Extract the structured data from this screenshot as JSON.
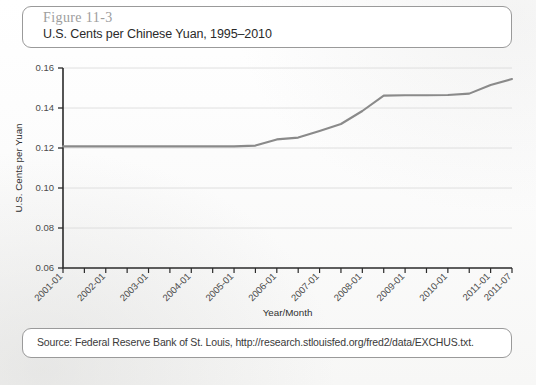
{
  "figure": {
    "number": "Figure 11-3",
    "title": "U.S. Cents per Chinese Yuan, 1995–2010",
    "source": "Source: Federal Reserve Bank of St. Louis, http://research.stlouisfed.org/fred2/data/EXCHUS.txt."
  },
  "colors": {
    "line": "#8a8a8a",
    "axis": "#2b2b2b",
    "grid": "#d8d8d8",
    "border": "#9a9a9a",
    "fig_number": "#9d9d9d"
  },
  "chart_data": {
    "type": "line",
    "title": "U.S. Cents per Chinese Yuan, 1995–2010",
    "xlabel": "Year/Month",
    "ylabel": "U.S. Cents per Yuan",
    "ylim": [
      0.06,
      0.16
    ],
    "ytick_labels": [
      "0.06",
      "0.08",
      "0.10",
      "0.12",
      "0.14",
      "0.16"
    ],
    "ytick_values": [
      0.06,
      0.08,
      0.1,
      0.12,
      0.14,
      0.16
    ],
    "xlim": [
      "2001-01",
      "2011-07"
    ],
    "xtick_labels": [
      "2001-01",
      "2002-01",
      "2003-01",
      "2004-01",
      "2005-01",
      "2006-01",
      "2007-01",
      "2008-01",
      "2009-01",
      "2010-01",
      "2011-01",
      "2011-07"
    ],
    "minor_tick_interval_months": 6,
    "grid": "horizontal",
    "legend": "none",
    "series": [
      {
        "name": "U.S. Cents per Yuan",
        "x": [
          "2001-01",
          "2002-01",
          "2003-01",
          "2004-01",
          "2005-01",
          "2005-07",
          "2006-01",
          "2006-07",
          "2007-01",
          "2007-07",
          "2008-01",
          "2008-07",
          "2009-01",
          "2009-07",
          "2010-01",
          "2010-07",
          "2011-01",
          "2011-07"
        ],
        "values": [
          0.1208,
          0.1208,
          0.1208,
          0.1208,
          0.1208,
          0.1212,
          0.1243,
          0.1252,
          0.1285,
          0.132,
          0.1385,
          0.1462,
          0.1464,
          0.1464,
          0.1465,
          0.1472,
          0.1515,
          0.1545
        ]
      }
    ]
  }
}
